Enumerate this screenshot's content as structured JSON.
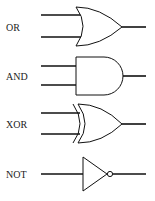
{
  "diagram": {
    "gates": [
      {
        "label": "OR",
        "type": "or",
        "inputs": 2
      },
      {
        "label": "AND",
        "type": "and",
        "inputs": 2
      },
      {
        "label": "XOR",
        "type": "xor",
        "inputs": 2
      },
      {
        "label": "NOT",
        "type": "not",
        "inputs": 1
      }
    ]
  }
}
